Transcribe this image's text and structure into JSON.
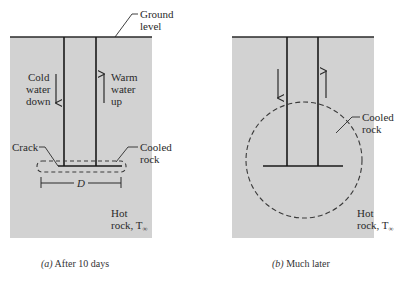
{
  "colors": {
    "rock_fill": "#d2d2d2",
    "line": "#2a2a2a",
    "background": "#ffffff"
  },
  "panel_a": {
    "ground_label_line1": "Ground",
    "ground_label_line2": "level",
    "cold_line1": "Cold",
    "cold_line2": "water",
    "cold_line3": "down",
    "warm_line1": "Warm",
    "warm_line2": "water",
    "warm_line3": "up",
    "crack_label": "Crack",
    "cooled_line1": "Cooled",
    "cooled_line2": "rock",
    "dimension_label": "D",
    "hot_line1": "Hot",
    "hot_line2": "rock, T",
    "hot_subscript": "∞",
    "caption_prefix": "(a)",
    "caption_text": " After 10 days"
  },
  "panel_b": {
    "cooled_line1": "Cooled",
    "cooled_line2": "rock",
    "hot_line1": "Hot",
    "hot_line2": "rock, T",
    "hot_subscript": "∞",
    "caption_prefix": "(b)",
    "caption_text": " Much later"
  }
}
